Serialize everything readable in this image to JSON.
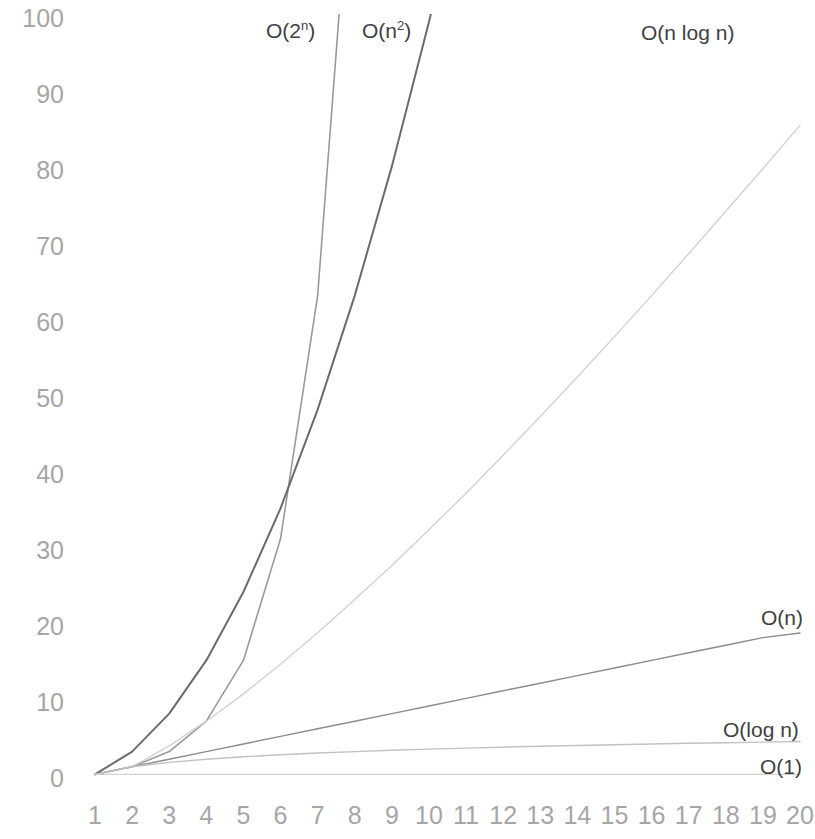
{
  "chart_data": {
    "type": "line",
    "title": "",
    "subtitle": "",
    "xlabel": "",
    "ylabel": "",
    "xlim": [
      1,
      20
    ],
    "ylim": [
      0,
      100
    ],
    "grid": false,
    "legend_position": "inline-labels",
    "background_color": "#ffffff",
    "x": [
      1,
      2,
      3,
      4,
      5,
      6,
      7,
      8,
      9,
      10,
      11,
      12,
      13,
      14,
      15,
      16,
      17,
      18,
      19,
      20
    ],
    "y_ticks": [
      "0",
      "10",
      "20",
      "30",
      "40",
      "50",
      "60",
      "70",
      "80",
      "90",
      "100"
    ],
    "x_ticks": [
      "1",
      "2",
      "3",
      "4",
      "5",
      "6",
      "7",
      "8",
      "9",
      "10",
      "11",
      "12",
      "13",
      "14",
      "15",
      "16",
      "17",
      "18",
      "19",
      "20"
    ],
    "series": [
      {
        "name": "O(2^n)",
        "label": "O(2",
        "label_sup": "n",
        "label_tail": ")",
        "color": "#9a9a9a",
        "values": [
          1,
          2,
          4,
          8,
          16,
          32,
          64,
          128,
          256,
          512,
          1024,
          2048,
          4096,
          8192,
          16384,
          32768,
          65536,
          131072,
          262144,
          524288
        ]
      },
      {
        "name": "O(n^2)",
        "label": "O(n",
        "label_sup": "2",
        "label_tail": ")",
        "color": "#6b6b6b",
        "values": [
          1,
          4,
          9,
          16,
          25,
          36,
          49,
          64,
          81,
          100,
          121,
          144,
          169,
          196,
          225,
          256,
          289,
          324,
          361,
          400
        ]
      },
      {
        "name": "O(n log n)",
        "label": "O(n log n)",
        "label_sup": "",
        "label_tail": "",
        "color": "#d2d2d2",
        "values": [
          1,
          2,
          4.75,
          8,
          11.6,
          15.5,
          19.65,
          24,
          28.5,
          33.2,
          38,
          43,
          48.1,
          53.3,
          58.6,
          64,
          69.5,
          75.1,
          80.7,
          86.4
        ]
      },
      {
        "name": "O(n)",
        "label": "O(n)",
        "label_sup": "",
        "label_tail": "",
        "color": "#8c8c8c",
        "values": [
          1,
          2,
          3,
          4,
          5,
          6,
          7,
          8,
          9,
          10,
          11,
          12,
          13,
          14,
          15,
          16,
          17,
          18,
          19,
          19.6
        ]
      },
      {
        "name": "O(log n)",
        "label": "O(log n)",
        "label_sup": "",
        "label_tail": "",
        "color": "#c2c2c2",
        "values": [
          1,
          2,
          2.58,
          3,
          3.32,
          3.58,
          3.81,
          4,
          4.17,
          4.32,
          4.46,
          4.58,
          4.7,
          4.81,
          4.91,
          5,
          5.09,
          5.17,
          5.25,
          5.32
        ]
      },
      {
        "name": "O(1)",
        "label": "O(1)",
        "label_sup": "",
        "label_tail": "",
        "color": "#cfcfcf",
        "values": [
          1,
          1,
          1,
          1,
          1,
          1,
          1,
          1,
          1,
          1,
          1,
          1,
          1,
          1,
          1,
          1,
          1,
          1,
          1,
          1
        ]
      }
    ],
    "annotations": [
      {
        "name": "label-o-2-n",
        "text": "O(2n)",
        "x": 296,
        "y": 20,
        "align": "left"
      },
      {
        "name": "label-o-n-2",
        "text": "O(n2)",
        "x": 362,
        "y": 20,
        "align": "left"
      },
      {
        "name": "label-o-n-log-n",
        "text": "O(n log n)",
        "x": 641,
        "y": 20,
        "align": "left"
      },
      {
        "name": "label-o-n",
        "text": "O(n)",
        "x": 761,
        "y": 607,
        "align": "left"
      },
      {
        "name": "label-o-log-n",
        "text": "O(log n)",
        "x": 723,
        "y": 720,
        "align": "left"
      },
      {
        "name": "label-o-1",
        "text": "O(1)",
        "x": 760,
        "y": 756,
        "align": "left"
      }
    ]
  }
}
